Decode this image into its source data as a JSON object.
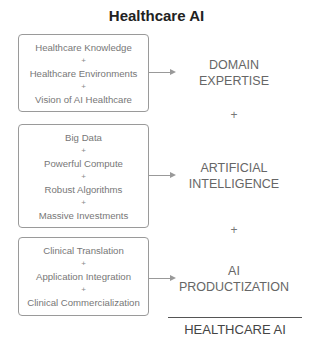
{
  "title": "Healthcare AI",
  "groups": [
    {
      "items": [
        "Healthcare Knowledge",
        "Healthcare Environments",
        "Vision of AI Healthcare"
      ],
      "label_lines": [
        "DOMAIN",
        "EXPERTISE"
      ]
    },
    {
      "items": [
        "Big Data",
        "Powerful Compute",
        "Robust Algorithms",
        "Massive Investments"
      ],
      "label_lines": [
        "ARTIFICIAL",
        "INTELLIGENCE"
      ]
    },
    {
      "items": [
        "Clinical Translation",
        "Application Integration",
        "Clinical Commercialization"
      ],
      "label_lines": [
        "AI",
        "PRODUCTIZATION"
      ]
    }
  ],
  "plus": "+",
  "result": "HEALTHCARE AI"
}
